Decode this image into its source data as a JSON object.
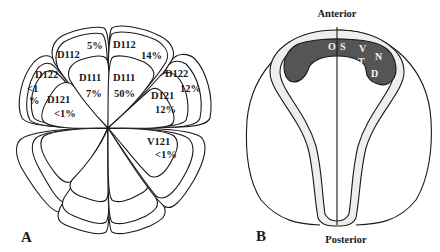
{
  "figure": {
    "panel_a": {
      "label": "A",
      "cells": [
        {
          "name": "D112",
          "value": "5%",
          "position": "upper-left-outer"
        },
        {
          "name": "D112",
          "value": "14%",
          "position": "upper-right-outer"
        },
        {
          "name": "D111",
          "value": "7%",
          "position": "left-inner"
        },
        {
          "name": "D111",
          "value": "50%",
          "position": "right-inner"
        },
        {
          "name": "D122",
          "value": "<1 %",
          "value_line1": "<1",
          "value_line2": "%",
          "position": "far-left"
        },
        {
          "name": "D121",
          "value": "<1%",
          "position": "left-lower"
        },
        {
          "name": "D122",
          "value": "12%",
          "position": "far-right"
        },
        {
          "name": "D121",
          "value": "12%",
          "position": "right-lower"
        },
        {
          "name": "V121",
          "value": "<1%",
          "position": "lower-right"
        }
      ]
    },
    "panel_b": {
      "label": "B",
      "top_label": "Anterior",
      "bottom_label": "Posterior",
      "region_letters": [
        "O",
        "S",
        "V",
        "N",
        "T",
        "D"
      ]
    }
  }
}
